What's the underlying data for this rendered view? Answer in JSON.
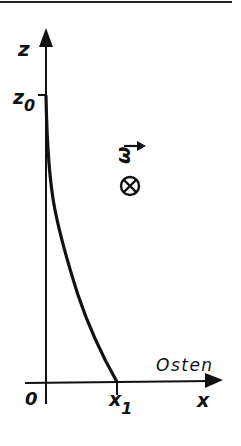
{
  "diagram": {
    "type": "trajectory-sketch",
    "axes": {
      "vertical_label": "z",
      "horizontal_label": "x",
      "origin_label": "0",
      "direction_label": "Osten"
    },
    "markers": {
      "z0_label": "z",
      "z0_subscript": "0",
      "x1_label": "x",
      "x1_subscript": "1"
    },
    "vector": {
      "symbol": "ω",
      "direction_symbol": "⊗",
      "meaning": "into the page"
    },
    "curve": {
      "description": "falling trajectory from z0 on z-axis to x1 on x-axis, deflected east"
    },
    "colors": {
      "ink": "#111111",
      "background": "#ffffff"
    }
  }
}
